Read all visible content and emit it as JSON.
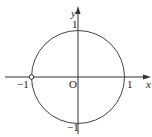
{
  "diagram": {
    "type": "unit-circle",
    "axes": {
      "x_label": "x",
      "y_label": "y",
      "origin_label": "O"
    },
    "ticks": {
      "x_pos": "1",
      "x_neg": "−1",
      "y_pos": "1",
      "y_neg": "−1"
    },
    "circle": {
      "center": [
        0,
        0
      ],
      "radius": 1
    },
    "open_point": {
      "coords": [
        -1,
        0
      ],
      "style": "hollow"
    },
    "colors": {
      "stroke": "#333333",
      "background": "#ffffff"
    }
  }
}
